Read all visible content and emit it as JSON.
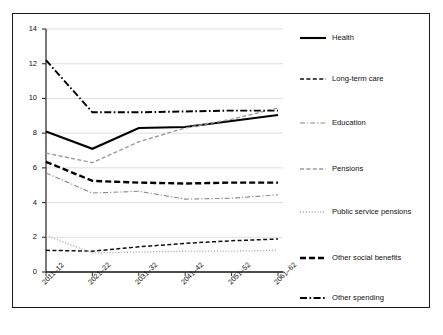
{
  "chart_data": {
    "type": "line",
    "title": "",
    "subtitle": "",
    "xlabel": "",
    "ylabel": "",
    "ylim": [
      0,
      14
    ],
    "yticks": [
      0,
      2,
      4,
      6,
      8,
      10,
      12,
      14
    ],
    "grid": true,
    "legend_position": "right",
    "categories": [
      "2011–12",
      "2021–22",
      "2031–32",
      "2041–42",
      "2051–52",
      "2061–62"
    ],
    "series": [
      {
        "name": "Health",
        "style": "solid",
        "color": "#000000",
        "width": 2.1,
        "values": [
          8.1,
          7.1,
          8.3,
          8.35,
          8.7,
          9.05
        ]
      },
      {
        "name": "Long-term care",
        "style": "dashed",
        "color": "#111111",
        "width": 1.5,
        "values": [
          1.25,
          1.2,
          1.45,
          1.65,
          1.8,
          1.9
        ]
      },
      {
        "name": "Education",
        "style": "dash-dot",
        "color": "#8a8a8a",
        "width": 1.1,
        "values": [
          5.7,
          4.55,
          4.65,
          4.2,
          4.25,
          4.45
        ]
      },
      {
        "name": "Pensions",
        "style": "dashed",
        "color": "#9a9a9a",
        "width": 1.4,
        "values": [
          6.85,
          6.3,
          7.5,
          8.3,
          8.8,
          9.45
        ]
      },
      {
        "name": "Public service pensions",
        "style": "dotted",
        "color": "#a9a9a9",
        "width": 1.3,
        "values": [
          2.1,
          1.1,
          1.15,
          1.2,
          1.2,
          1.25
        ]
      },
      {
        "name": "Other social benefits",
        "style": "dashed-thick",
        "color": "#000000",
        "width": 2.4,
        "values": [
          6.35,
          5.25,
          5.15,
          5.1,
          5.15,
          5.15
        ]
      },
      {
        "name": "Other spending",
        "style": "dash-dot-thick",
        "color": "#000000",
        "width": 1.9,
        "values": [
          12.2,
          9.2,
          9.2,
          9.25,
          9.3,
          9.3
        ]
      }
    ]
  },
  "axes": {
    "y_tick_labels": [
      "14",
      "12",
      "10",
      "8",
      "6",
      "4",
      "2",
      "0"
    ],
    "x_tick_labels": [
      "2011–12",
      "2021–22",
      "2031–32",
      "2041–42",
      "2051–52",
      "2061–62"
    ]
  },
  "legend": {
    "items": [
      {
        "label": "Health"
      },
      {
        "label": "Long-term care"
      },
      {
        "label": "Education"
      },
      {
        "label": "Pensions"
      },
      {
        "label": "Public service pensions"
      },
      {
        "label": "Other social benefits"
      },
      {
        "label": "Other spending"
      }
    ]
  }
}
